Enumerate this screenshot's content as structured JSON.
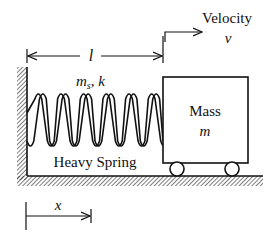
{
  "diagram": {
    "labels": {
      "velocity_word": "Velocity",
      "velocity_symbol": "v",
      "length_symbol": "l",
      "spring_params_m": "m",
      "spring_params_sub": "s",
      "spring_params_rest": ", k",
      "mass_word": "Mass",
      "mass_symbol": "m",
      "spring_name": "Heavy Spring",
      "position_symbol": "x"
    },
    "spring_coils": 6,
    "colors": {
      "ink": "#111111",
      "background": "#ffffff"
    }
  }
}
